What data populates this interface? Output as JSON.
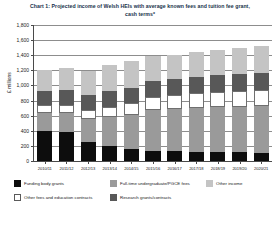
{
  "chart_data": {
    "type": "bar",
    "stacked": true,
    "title": "Chart 1: Projected income of Welsh HEIs with average known fees and tuition fee grant, cash terms*",
    "xlabel": "",
    "ylabel": "£ millions",
    "ylim": [
      0,
      1800
    ],
    "ytick_step": 200,
    "yticks": [
      "0",
      "200",
      "400",
      "600",
      "800",
      "1,000",
      "1,200",
      "1,400",
      "1,600",
      "1,800"
    ],
    "grid": true,
    "legend_position": "bottom",
    "categories": [
      "2010/11",
      "2011/12",
      "2012/13",
      "2013/14",
      "2014/15",
      "2015/16",
      "2016/17",
      "2017/18",
      "2018/19",
      "2019/20",
      "2020/21"
    ],
    "series": [
      {
        "name": "Funding body grants",
        "color": "#0d0d0d",
        "values": [
          400,
          390,
          250,
          205,
          160,
          135,
          130,
          125,
          120,
          115,
          105
        ]
      },
      {
        "name": "Full-time undergraduate/PGCE fees",
        "color": "#9a9a9a",
        "values": [
          240,
          250,
          310,
          380,
          450,
          545,
          565,
          580,
          595,
          605,
          620
        ]
      },
      {
        "name": "Other fees and education contracts",
        "color": "#ffffff",
        "values": [
          100,
          105,
          115,
          135,
          155,
          170,
          180,
          190,
          200,
          210,
          215
        ]
      },
      {
        "name": "Research grants/contracts",
        "color": "#585858",
        "values": [
          190,
          195,
          200,
          205,
          205,
          210,
          215,
          215,
          220,
          225,
          225
        ]
      },
      {
        "name": "Other income",
        "color": "#c4c4c4",
        "values": [
          275,
          285,
          320,
          345,
          350,
          325,
          315,
          335,
          340,
          345,
          355
        ]
      }
    ],
    "totals": [
      1205,
      1225,
      1195,
      1270,
      1320,
      1385,
      1405,
      1445,
      1475,
      1500,
      1520
    ]
  },
  "legend": {
    "items": [
      {
        "label": "Funding body grants",
        "swatch": "sw-funding"
      },
      {
        "label": "Other fees and education contracts",
        "swatch": "sw-otherfees"
      },
      {
        "label": "Full-time undergraduate/PGCE fees",
        "swatch": "sw-ftfees"
      },
      {
        "label": "Research grants/contracts",
        "swatch": "sw-research"
      },
      {
        "label": "Other income",
        "swatch": "sw-otherinc"
      }
    ]
  }
}
